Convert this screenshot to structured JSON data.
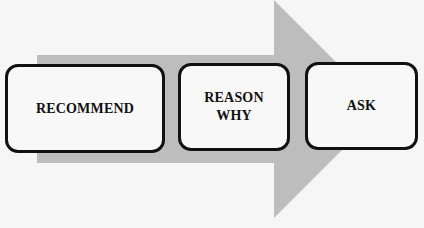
{
  "diagram": {
    "type": "process-flow",
    "arrow": {
      "color": "#bdbdbd",
      "direction": "right"
    },
    "steps": [
      {
        "label": "RECOMMEND"
      },
      {
        "label": "REASON\nWHY"
      },
      {
        "label": "ASK"
      }
    ]
  }
}
